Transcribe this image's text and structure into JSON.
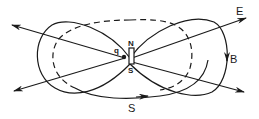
{
  "diagram": {
    "labels": {
      "charge": "q",
      "north_pole": "N",
      "south_pole": "S",
      "electric_field": "E",
      "magnetic_field": "B",
      "poynting": "S"
    },
    "colors": {
      "stroke": "#1a1a1a",
      "background": "#ffffff"
    }
  }
}
